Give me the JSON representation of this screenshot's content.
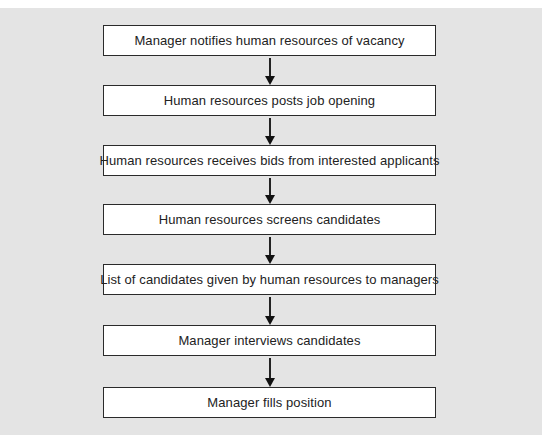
{
  "diagram": {
    "type": "flowchart",
    "direction": "top-to-bottom",
    "colors": {
      "background": "#e4e4e4",
      "box_fill": "#ffffff",
      "box_border": "#2a2a2a",
      "text": "#222222",
      "arrow": "#111111"
    },
    "steps": [
      {
        "label": "Manager notifies human resources of vacancy"
      },
      {
        "label": "Human resources posts job opening"
      },
      {
        "label": "Human resources receives bids from interested applicants"
      },
      {
        "label": "Human resources screens candidates"
      },
      {
        "label": "List of candidates given by human resources to managers"
      },
      {
        "label": "Manager interviews candidates"
      },
      {
        "label": "Manager fills position"
      }
    ],
    "arrows": [
      {
        "from": 0,
        "to": 1
      },
      {
        "from": 1,
        "to": 2
      },
      {
        "from": 2,
        "to": 3
      },
      {
        "from": 3,
        "to": 4
      },
      {
        "from": 4,
        "to": 5
      },
      {
        "from": 5,
        "to": 6
      }
    ]
  }
}
